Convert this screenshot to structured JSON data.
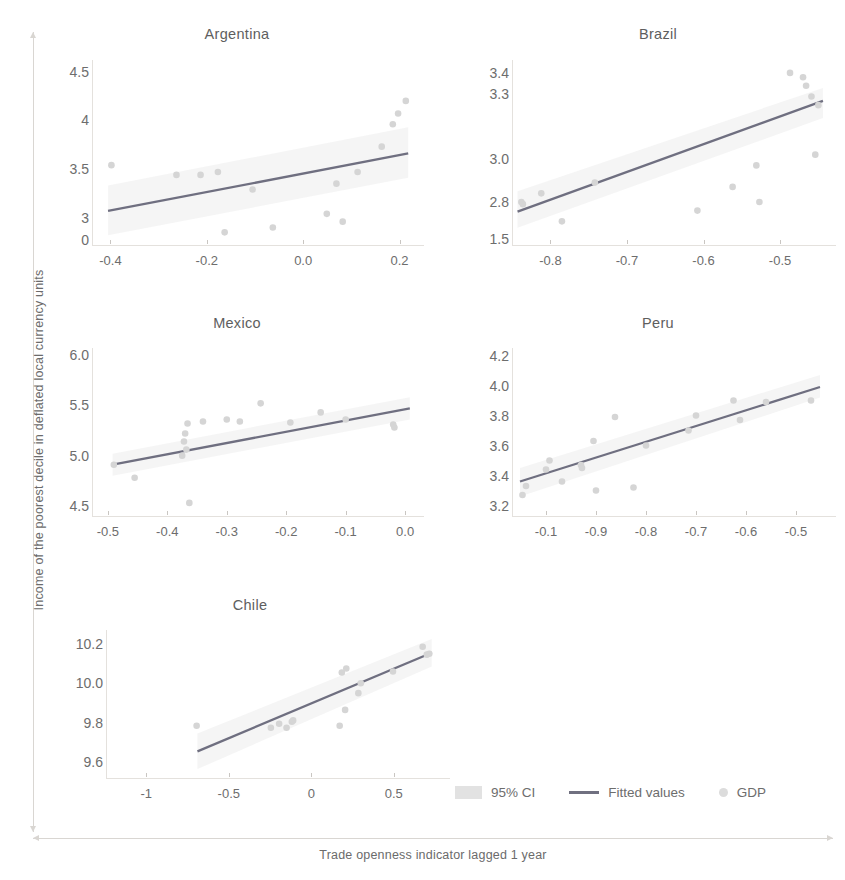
{
  "axis_titles": {
    "y": "Income of the poorest decile in deflated local currency units",
    "x": "Trade openness indicator lagged 1 year"
  },
  "legend": {
    "ci": "95% CI",
    "fit": "Fitted values",
    "points": "GDP"
  },
  "colors": {
    "fitted_line": "#6f6f80",
    "points": "#d5d5d5",
    "ci_band": "#ececec",
    "text": "#6d6d6d",
    "axis": "#d9d6d2"
  },
  "chart_data": [
    {
      "type": "scatter",
      "title": "Argentina",
      "xlabel": "",
      "ylabel": "",
      "xlim": [
        -0.43,
        0.23
      ],
      "ylim": [
        2.72,
        4.62
      ],
      "xticks": [
        "-0.4",
        "-0.2",
        "0.0",
        "0.2"
      ],
      "xtick_values": [
        -0.4,
        -0.2,
        0.0,
        0.2
      ],
      "yticks": [
        "4.5",
        "4",
        "3.5",
        "3",
        "0"
      ],
      "ytick_values": [
        4.5,
        4.0,
        3.5,
        3.0,
        2.77
      ],
      "grid": false,
      "points": [
        {
          "x": -0.398,
          "y": 3.54
        },
        {
          "x": -0.263,
          "y": 3.44
        },
        {
          "x": -0.213,
          "y": 3.44
        },
        {
          "x": -0.177,
          "y": 3.47
        },
        {
          "x": -0.163,
          "y": 2.85
        },
        {
          "x": -0.105,
          "y": 3.29
        },
        {
          "x": -0.063,
          "y": 2.9
        },
        {
          "x": 0.049,
          "y": 3.04
        },
        {
          "x": 0.069,
          "y": 3.35
        },
        {
          "x": 0.082,
          "y": 2.96
        },
        {
          "x": 0.113,
          "y": 3.47
        },
        {
          "x": 0.163,
          "y": 3.73
        },
        {
          "x": 0.186,
          "y": 3.96
        },
        {
          "x": 0.197,
          "y": 4.07
        },
        {
          "x": 0.213,
          "y": 4.2
        }
      ],
      "fit": {
        "x0": -0.405,
        "y0": 3.07,
        "x1": 0.218,
        "y1": 3.66
      },
      "ci": {
        "x0": -0.405,
        "lo0": 2.82,
        "hi0": 3.33,
        "x1": 0.218,
        "lo1": 3.41,
        "hi1": 3.93
      }
    },
    {
      "type": "scatter",
      "title": "Brazil",
      "xlabel": "",
      "ylabel": "",
      "xlim": [
        -0.845,
        -0.44
      ],
      "ylim": [
        2.6,
        3.46
      ],
      "xticks": [
        "-0.8",
        "-0.7",
        "-0.6",
        "-0.5"
      ],
      "xtick_values": [
        -0.8,
        -0.7,
        -0.6,
        -0.5
      ],
      "yticks": [
        "3.4",
        "3.3",
        "3.0",
        "2.8",
        "1.5"
      ],
      "ytick_values": [
        3.4,
        3.3,
        3.0,
        2.8,
        2.63
      ],
      "grid": false,
      "points": [
        {
          "x": -0.838,
          "y": 2.8
        },
        {
          "x": -0.836,
          "y": 2.79
        },
        {
          "x": -0.812,
          "y": 2.84
        },
        {
          "x": -0.785,
          "y": 2.71
        },
        {
          "x": -0.742,
          "y": 2.89
        },
        {
          "x": -0.608,
          "y": 2.76
        },
        {
          "x": -0.562,
          "y": 2.87
        },
        {
          "x": -0.531,
          "y": 2.97
        },
        {
          "x": -0.527,
          "y": 2.8
        },
        {
          "x": -0.487,
          "y": 3.4
        },
        {
          "x": -0.47,
          "y": 3.38
        },
        {
          "x": -0.466,
          "y": 3.34
        },
        {
          "x": -0.459,
          "y": 3.29
        },
        {
          "x": -0.454,
          "y": 3.02
        },
        {
          "x": -0.45,
          "y": 3.25
        }
      ],
      "fit": {
        "x0": -0.843,
        "y0": 2.755,
        "x1": -0.444,
        "y1": 3.27
      },
      "ci": {
        "x0": -0.843,
        "lo0": 2.68,
        "hi0": 2.85,
        "x1": -0.444,
        "lo1": 3.19,
        "hi1": 3.33
      }
    },
    {
      "type": "scatter",
      "title": "Mexico",
      "xlabel": "",
      "ylabel": "",
      "xlim": [
        -0.52,
        0.015
      ],
      "ylim": [
        4.4,
        6.07
      ],
      "xticks": [
        "-0.5",
        "-0.4",
        "-0.3",
        "-0.2",
        "-0.1",
        "0.0"
      ],
      "xtick_values": [
        -0.5,
        -0.4,
        -0.3,
        -0.2,
        -0.1,
        0.0
      ],
      "yticks": [
        "6.0",
        "5.5",
        "5.0",
        "4.5"
      ],
      "ytick_values": [
        6.0,
        5.5,
        5.0,
        4.5
      ],
      "grid": false,
      "points": [
        {
          "x": -0.49,
          "y": 4.91
        },
        {
          "x": -0.455,
          "y": 4.78
        },
        {
          "x": -0.375,
          "y": 5.0
        },
        {
          "x": -0.372,
          "y": 5.14
        },
        {
          "x": -0.37,
          "y": 5.22
        },
        {
          "x": -0.368,
          "y": 5.06
        },
        {
          "x": -0.366,
          "y": 5.32
        },
        {
          "x": -0.363,
          "y": 4.53
        },
        {
          "x": -0.34,
          "y": 5.34
        },
        {
          "x": -0.3,
          "y": 5.36
        },
        {
          "x": -0.278,
          "y": 5.34
        },
        {
          "x": -0.243,
          "y": 5.52
        },
        {
          "x": -0.193,
          "y": 5.33
        },
        {
          "x": -0.142,
          "y": 5.43
        },
        {
          "x": -0.1,
          "y": 5.36
        },
        {
          "x": -0.02,
          "y": 5.31
        },
        {
          "x": -0.018,
          "y": 5.28
        }
      ],
      "fit": {
        "x0": -0.492,
        "y0": 4.91,
        "x1": 0.008,
        "y1": 5.47
      },
      "ci": {
        "x0": -0.492,
        "lo0": 4.8,
        "hi0": 5.02,
        "x1": 0.008,
        "lo1": 5.36,
        "hi1": 5.58
      }
    },
    {
      "type": "scatter",
      "title": "Peru",
      "xlabel": "",
      "ylabel": "",
      "xlim": [
        -1.06,
        -0.44
      ],
      "ylim": [
        3.13,
        4.25
      ],
      "xticks": [
        "-0.1",
        "-0.9",
        "-0.8",
        "-0.7",
        "-0.6",
        "-0.5"
      ],
      "xtick_values": [
        -1.0,
        -0.9,
        -0.8,
        -0.7,
        -0.6,
        -0.5
      ],
      "yticks": [
        "4.2",
        "4.0",
        "3.8",
        "3.6",
        "3.4",
        "3.2"
      ],
      "ytick_values": [
        4.2,
        4.0,
        3.8,
        3.6,
        3.4,
        3.2
      ],
      "grid": false,
      "points": [
        {
          "x": -1.047,
          "y": 3.27
        },
        {
          "x": -1.04,
          "y": 3.33
        },
        {
          "x": -1.0,
          "y": 3.44
        },
        {
          "x": -0.993,
          "y": 3.5
        },
        {
          "x": -0.968,
          "y": 3.36
        },
        {
          "x": -0.93,
          "y": 3.47
        },
        {
          "x": -0.928,
          "y": 3.45
        },
        {
          "x": -0.905,
          "y": 3.63
        },
        {
          "x": -0.9,
          "y": 3.3
        },
        {
          "x": -0.862,
          "y": 3.79
        },
        {
          "x": -0.825,
          "y": 3.32
        },
        {
          "x": -0.8,
          "y": 3.6
        },
        {
          "x": -0.715,
          "y": 3.7
        },
        {
          "x": -0.7,
          "y": 3.8
        },
        {
          "x": -0.625,
          "y": 3.9
        },
        {
          "x": -0.612,
          "y": 3.77
        },
        {
          "x": -0.56,
          "y": 3.89
        },
        {
          "x": -0.47,
          "y": 3.9
        }
      ],
      "fit": {
        "x0": -1.052,
        "y0": 3.36,
        "x1": -0.452,
        "y1": 3.99
      },
      "ci": {
        "x0": -1.052,
        "lo0": 3.26,
        "hi0": 3.45,
        "x1": -0.452,
        "lo1": 3.92,
        "hi1": 4.07
      }
    },
    {
      "type": "scatter",
      "title": "Chile",
      "xlabel": "",
      "ylabel": "",
      "xlim": [
        -1.22,
        0.78
      ],
      "ylim": [
        9.52,
        10.27
      ],
      "xticks": [
        "-1",
        "-0.5",
        "0",
        "0.5"
      ],
      "xtick_values": [
        -1,
        -0.5,
        0,
        0.5
      ],
      "yticks": [
        "10.2",
        "10.0",
        "9.8",
        "9.6"
      ],
      "ytick_values": [
        10.2,
        10.0,
        9.8,
        9.6
      ],
      "grid": false,
      "points": [
        {
          "x": -0.695,
          "y": 9.785
        },
        {
          "x": -0.245,
          "y": 9.775
        },
        {
          "x": -0.195,
          "y": 9.795
        },
        {
          "x": -0.15,
          "y": 9.775
        },
        {
          "x": -0.118,
          "y": 9.805
        },
        {
          "x": -0.11,
          "y": 9.812
        },
        {
          "x": 0.172,
          "y": 9.785
        },
        {
          "x": 0.185,
          "y": 10.055
        },
        {
          "x": 0.205,
          "y": 9.865
        },
        {
          "x": 0.212,
          "y": 10.075
        },
        {
          "x": 0.285,
          "y": 9.95
        },
        {
          "x": 0.3,
          "y": 10.0
        },
        {
          "x": 0.495,
          "y": 10.06
        },
        {
          "x": 0.675,
          "y": 10.185
        },
        {
          "x": 0.7,
          "y": 10.145
        },
        {
          "x": 0.715,
          "y": 10.15
        }
      ],
      "fit": {
        "x0": -0.69,
        "y0": 9.655,
        "x1": 0.73,
        "y1": 10.155
      },
      "ci": {
        "x0": -0.69,
        "lo0": 9.565,
        "hi0": 9.745,
        "x1": 0.73,
        "lo1": 10.085,
        "hi1": 10.225
      }
    }
  ]
}
